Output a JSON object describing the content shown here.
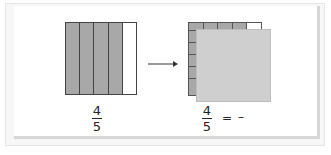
{
  "diagram": {
    "left_model": {
      "columns": 5,
      "shaded_columns": 4,
      "shade_color": "#a8a8a8",
      "unshaded_color": "#ffffff",
      "fraction": {
        "numerator": "4",
        "denominator": "5"
      }
    },
    "arrow": {
      "direction": "right"
    },
    "right_model": {
      "columns": 5,
      "shaded_columns": 4,
      "rows": 5,
      "overlay_color": "#cfcfcf",
      "fraction": {
        "numerator": "4",
        "denominator": "5"
      },
      "equals": "=",
      "blank": "–"
    }
  }
}
